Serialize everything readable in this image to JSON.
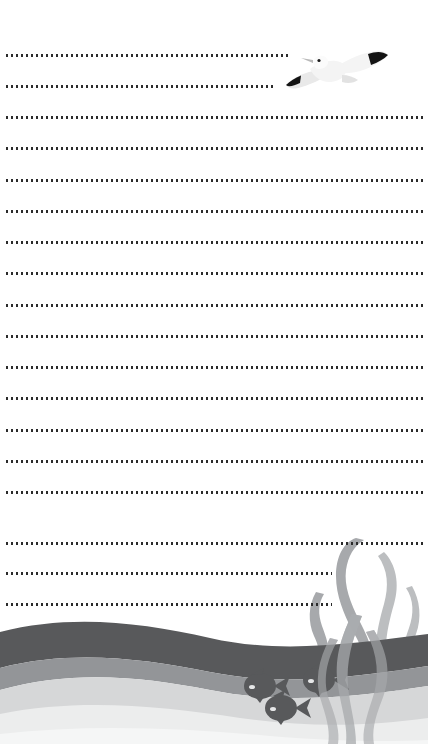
{
  "page": {
    "kind": "lined-writing-stationery",
    "width": 428,
    "height": 744,
    "background_color": "#ffffff",
    "text_content": "",
    "placeholder": ""
  },
  "rules": {
    "dot_color": "#2b2b2b",
    "dot_size_px": 2,
    "dot_gap_px": 3,
    "left_margin_px": 6,
    "count": 18,
    "lines": [
      {
        "index": 1,
        "y": 55,
        "right_edge": 289,
        "note": "shortened for seagull"
      },
      {
        "index": 2,
        "y": 86,
        "right_edge": 276,
        "note": "shortened for seagull"
      },
      {
        "index": 3,
        "y": 117,
        "right_edge": 423,
        "note": "full width"
      },
      {
        "index": 4,
        "y": 148,
        "right_edge": 423,
        "note": "full width"
      },
      {
        "index": 5,
        "y": 180,
        "right_edge": 423,
        "note": "full width"
      },
      {
        "index": 6,
        "y": 211,
        "right_edge": 423,
        "note": "full width"
      },
      {
        "index": 7,
        "y": 242,
        "right_edge": 423,
        "note": "full width"
      },
      {
        "index": 8,
        "y": 273,
        "right_edge": 423,
        "note": "full width"
      },
      {
        "index": 9,
        "y": 305,
        "right_edge": 423,
        "note": "full width"
      },
      {
        "index": 10,
        "y": 336,
        "right_edge": 423,
        "note": "full width"
      },
      {
        "index": 11,
        "y": 367,
        "right_edge": 423,
        "note": "full width"
      },
      {
        "index": 12,
        "y": 398,
        "right_edge": 423,
        "note": "full width"
      },
      {
        "index": 13,
        "y": 430,
        "right_edge": 423,
        "note": "full width"
      },
      {
        "index": 14,
        "y": 461,
        "right_edge": 423,
        "note": "full width"
      },
      {
        "index": 15,
        "y": 492,
        "right_edge": 423,
        "note": "full width"
      },
      {
        "index": 16,
        "y": 543,
        "right_edge": 423,
        "note": "full width"
      },
      {
        "index": 17,
        "y": 573,
        "right_edge": 332,
        "note": "shortened for seaweed"
      },
      {
        "index": 18,
        "y": 604,
        "right_edge": 332,
        "note": "shortened for seaweed"
      }
    ]
  },
  "seagull": {
    "name": "seagull-illustration",
    "x": 286,
    "y": 47,
    "width": 104,
    "height": 52,
    "body_color": "#f4f4f4",
    "body_shade_color": "#e2e2e2",
    "wingtip_color": "#141414",
    "beak_color": "#b9b9b9",
    "eye_color": "#1a1a1a"
  },
  "ocean": {
    "name": "ocean-scene",
    "height": 150,
    "wave_dark_color": "#58595b",
    "wave_mid_color": "#939598",
    "wave_light_color": "#d6d7d8",
    "wave_pale_color": "#eceded",
    "wave_palest_color": "#f5f6f6",
    "waterline_y_from_bottom": 108
  },
  "seaweed": {
    "name": "seaweed-cluster",
    "color_front": "#a7a9ac",
    "color_back": "#bcbec0",
    "color_submerged": "#b2b4b7",
    "strand_count": 5,
    "x": 300,
    "width": 128
  },
  "fish": {
    "name": "fish-group",
    "color": "#58595b",
    "eye_color": "#e6e7e8",
    "count": 3,
    "items": [
      {
        "id": 1,
        "x": 244,
        "y": 678,
        "width": 42,
        "height": 27,
        "facing": "left"
      },
      {
        "id": 2,
        "x": 303,
        "y": 672,
        "width": 42,
        "height": 27,
        "facing": "left"
      },
      {
        "id": 3,
        "x": 265,
        "y": 700,
        "width": 42,
        "height": 27,
        "facing": "left"
      }
    ]
  }
}
